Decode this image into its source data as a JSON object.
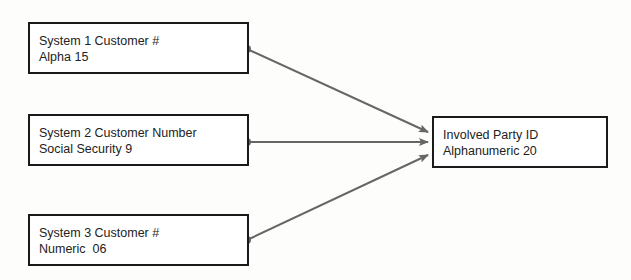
{
  "diagram": {
    "sources": [
      {
        "line1": "System 1 Customer #",
        "line2": "Alpha 15"
      },
      {
        "line1": "System 2 Customer Number",
        "line2": "Social Security 9"
      },
      {
        "line1": "System 3 Customer #",
        "line2": "Numeric  06"
      }
    ],
    "target": {
      "line1": "Involved Party ID",
      "line2": "Alphanumeric 20"
    },
    "colors": {
      "connector": "#666666",
      "border": "#1a1a1a"
    }
  }
}
